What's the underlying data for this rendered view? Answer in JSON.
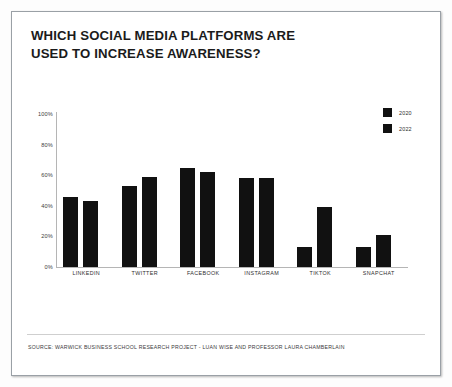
{
  "title": "WHICH SOCIAL MEDIA PLATFORMS ARE\nUSED TO INCREASE AWARENESS?",
  "source": "SOURCE: WARWICK BUSINESS SCHOOL RESEARCH PROJECT - LUAN WISE AND PROFESSOR LAURA CHAMBERLAIN",
  "legend": {
    "items": [
      {
        "label": "2020",
        "color": "#111111"
      },
      {
        "label": "2022",
        "color": "#111111"
      }
    ]
  },
  "chart_data": {
    "type": "bar",
    "title": "WHICH SOCIAL MEDIA PLATFORMS ARE USED TO INCREASE AWARENESS?",
    "xlabel": "",
    "ylabel": "",
    "ylim": [
      0,
      100
    ],
    "yticks": [
      100,
      80,
      60,
      40,
      20,
      0
    ],
    "ytick_labels": [
      "100%",
      "80%",
      "60%",
      "40%",
      "20%",
      "0%"
    ],
    "grid": false,
    "legend_position": "top-right",
    "categories": [
      "LINKEDIN",
      "TWITTER",
      "FACEBOOK",
      "INSTAGRAM",
      "TIKTOK",
      "SNAPCHAT"
    ],
    "series": [
      {
        "name": "2020",
        "color": "#111111",
        "values": [
          46,
          53,
          65,
          58,
          13,
          13
        ]
      },
      {
        "name": "2022",
        "color": "#111111",
        "values": [
          43,
          59,
          62,
          58,
          39,
          21
        ]
      }
    ]
  }
}
